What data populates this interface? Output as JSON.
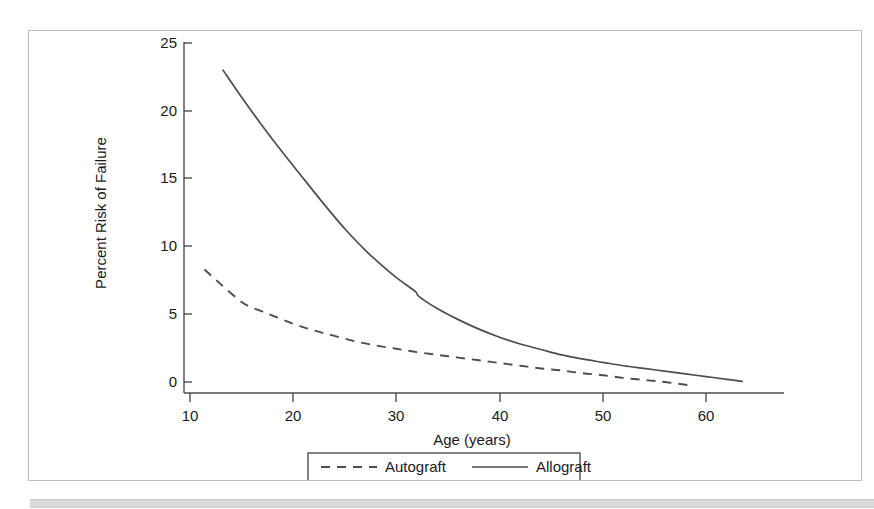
{
  "figure": {
    "frame": {
      "border_color": "#b9bbbd"
    },
    "background": "#ffffff",
    "bottom_band_color": "#d7d9da"
  },
  "chart_data": {
    "type": "line",
    "title": "",
    "xlabel": "Age (years)",
    "ylabel": "Percent Risk of Failure",
    "xlim": [
      8.5,
      64.5
    ],
    "ylim": [
      -0.9,
      26.2
    ],
    "xticks": [
      10,
      20,
      30,
      40,
      50,
      60
    ],
    "xticklabels": [
      "10",
      "20",
      "30",
      "40",
      "50",
      "60"
    ],
    "yticks": [
      0,
      5,
      10,
      15,
      20,
      25
    ],
    "yticklabels": [
      "0",
      "5",
      "10",
      "15",
      "20",
      "25"
    ],
    "grid": false,
    "legend_position": "below-axes",
    "line_color": "#4d4d4d",
    "series": [
      {
        "name": "Autograft",
        "style": "dashed",
        "color": "#4d4d4d",
        "x": [
          11.4,
          13,
          15,
          16,
          17,
          18,
          20,
          22,
          24,
          26,
          28,
          30,
          32,
          34,
          36,
          38,
          40,
          42,
          44,
          46,
          48,
          50,
          52,
          54,
          56,
          58.5
        ],
        "y": [
          8.3,
          7.2,
          5.9,
          5.5,
          5.2,
          4.9,
          4.3,
          3.8,
          3.4,
          3.0,
          2.7,
          2.45,
          2.2,
          2.0,
          1.8,
          1.6,
          1.4,
          1.2,
          1.0,
          0.85,
          0.65,
          0.5,
          0.3,
          0.15,
          0.0,
          -0.25
        ]
      },
      {
        "name": "Allograft",
        "style": "solid",
        "color": "#4d4d4d",
        "x": [
          13.2,
          15,
          17,
          19,
          21,
          23,
          25,
          27,
          28,
          30,
          31.8,
          32.2,
          34,
          36,
          38,
          40,
          42,
          44,
          46,
          48,
          50,
          52,
          54,
          56,
          58,
          60,
          62,
          63.5
        ],
        "y": [
          23.0,
          21.0,
          18.9,
          16.9,
          15.0,
          13.1,
          11.3,
          9.7,
          9.0,
          7.7,
          6.7,
          6.3,
          5.4,
          4.6,
          3.9,
          3.3,
          2.8,
          2.4,
          2.0,
          1.7,
          1.45,
          1.2,
          1.0,
          0.8,
          0.6,
          0.4,
          0.2,
          0.05
        ]
      }
    ]
  },
  "legend": {
    "items": [
      {
        "label": "Autograft",
        "style": "dashed"
      },
      {
        "label": "Allograft",
        "style": "solid"
      }
    ]
  }
}
